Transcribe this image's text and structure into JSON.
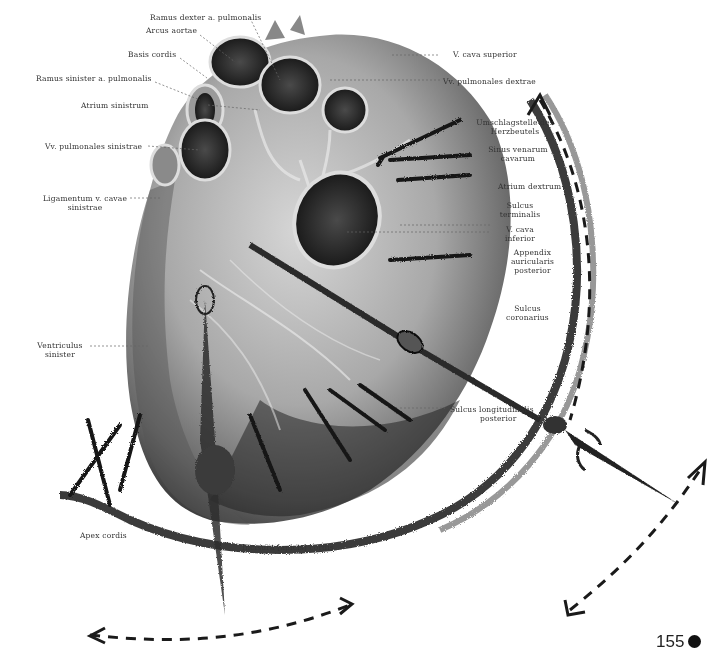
{
  "page": {
    "number": "155",
    "marker": "filled-circle"
  },
  "figure": {
    "overlay": "clock-sketch-with-hands-and-arrows"
  },
  "labels": {
    "ramus_dexter": "Ramus dexter a. pulmonalis",
    "arcus_aortae": "Arcus aortae",
    "basis_cordis": "Basis cordis",
    "ramus_sinister": "Ramus sinister a. pulmonalis",
    "atrium_sinistrum": "Atrium sinistrum",
    "vv_pulm_sinistrae": "Vv. pulmonales sinistrae",
    "ligamentum_1": "Ligamentum v. cavae",
    "ligamentum_2": "sinistrae",
    "ventriculus_1": "Ventriculus",
    "ventriculus_2": "sinister",
    "apex_cordis": "Apex cordis",
    "incisura": "Incisura [apicis] cordis",
    "v_cava_superior": "V. cava superior",
    "vv_pulm_dextrae": "Vv. pulmonales dextrae",
    "umschlag_1": "Umschlagstelle des",
    "umschlag_2": "Herzbeutels",
    "sinus_1": "Sinus venarum",
    "sinus_2": "cavarum",
    "atrium_dextrum": "Atrium dextrum",
    "sulcus_term_1": "Sulcus",
    "sulcus_term_2": "terminalis",
    "v_cava_inf_1": "V. cava",
    "v_cava_inf_2": "inferior",
    "appendix_1": "Appendix",
    "appendix_2": "auricularis",
    "appendix_3": "posterior",
    "sulcus_cor_1": "Sulcus",
    "sulcus_cor_2": "coronarius",
    "sulcus_long_1": "Sulcus longitudinalis",
    "sulcus_long_2": "posterior"
  }
}
